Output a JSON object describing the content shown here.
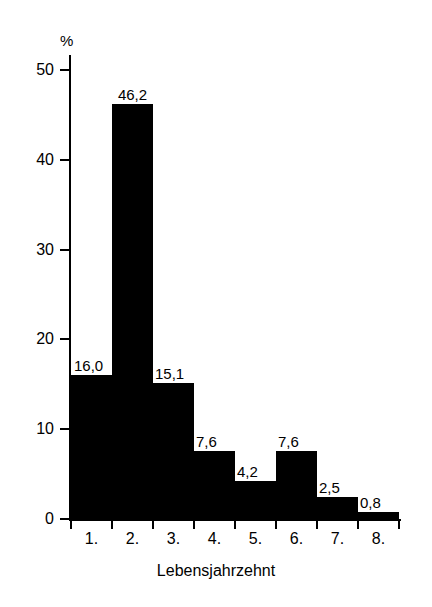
{
  "chart_data": {
    "type": "bar",
    "title": "",
    "subtitle": "",
    "xlabel": "Lebensjahrzehnt",
    "ylabel": "",
    "y_unit": "%",
    "categories": [
      "1.",
      "2.",
      "3.",
      "4.",
      "5.",
      "6.",
      "7.",
      "8."
    ],
    "values": [
      16.0,
      46.2,
      15.1,
      7.6,
      4.2,
      7.6,
      2.5,
      0.8
    ],
    "value_labels": [
      "16,0",
      "46,2",
      "15,1",
      "7,6",
      "4,2",
      "7,6",
      "2,5",
      "0,8"
    ],
    "ylim": [
      0,
      52
    ],
    "yticks": [
      0,
      10,
      20,
      30,
      40,
      50
    ],
    "ytick_labels": [
      "0",
      "10",
      "20",
      "30",
      "40",
      "50"
    ],
    "grid": false,
    "legend": null,
    "bar_color": "#000000",
    "background_color": "#ffffff",
    "axis_color": "#000000",
    "bars_contiguous": true
  }
}
